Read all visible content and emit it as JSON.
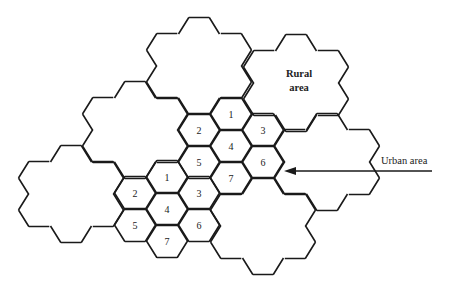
{
  "diagram": {
    "cell_numbers": [
      "1",
      "2",
      "3",
      "4",
      "5",
      "6",
      "7"
    ],
    "labels": {
      "rural": [
        "Rural",
        "area"
      ],
      "urban": "Urban area"
    },
    "geometry": {
      "hex_radius": 20.5,
      "hex_half_height": 16.5,
      "col_step": 32,
      "row_step": 32,
      "cluster_shape_offsets": [
        [
          0,
          -1
        ],
        [
          -1,
          0
        ],
        [
          1,
          -1
        ],
        [
          0,
          0
        ],
        [
          -1,
          1
        ],
        [
          1,
          0
        ],
        [
          0,
          1
        ]
      ]
    },
    "clusters": [
      {
        "name": "urban-cluster-upper",
        "center": [
          231,
          146
        ],
        "type": "urban"
      },
      {
        "name": "urban-cluster-lower",
        "center": [
          167,
          209
        ],
        "type": "urban"
      },
      {
        "name": "rural-cluster-labeled",
        "center": [
          296,
          83
        ],
        "type": "rural"
      },
      {
        "name": "rural-cluster-top",
        "center": [
          199,
          66
        ],
        "type": "rural"
      },
      {
        "name": "rural-cluster-left-upper",
        "center": [
          135,
          130
        ],
        "type": "rural"
      },
      {
        "name": "rural-cluster-left-lower",
        "center": [
          71,
          194
        ],
        "type": "rural"
      },
      {
        "name": "rural-cluster-right",
        "center": [
          327,
          162
        ],
        "type": "rural"
      },
      {
        "name": "rural-cluster-bottom-right",
        "center": [
          263,
          226
        ],
        "type": "rural"
      }
    ],
    "arrow": {
      "from": [
        432,
        171
      ],
      "to": [
        284,
        171
      ]
    }
  }
}
